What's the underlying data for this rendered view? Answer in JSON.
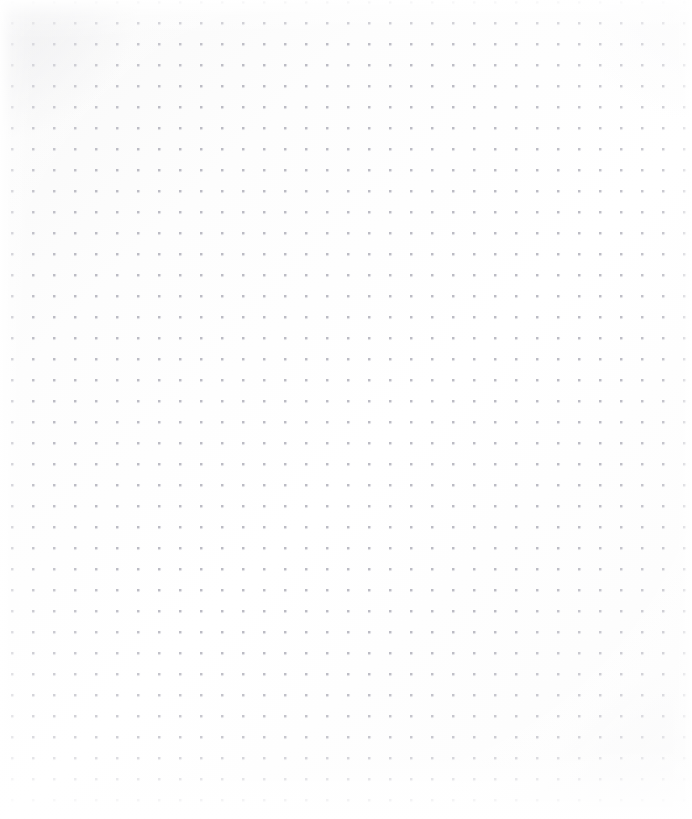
{
  "page": {
    "title": "Dot Grid Canvas",
    "kind": "blank-dot-grid",
    "width_px": 692,
    "height_px": 819,
    "visible_text": "",
    "notes_label": ""
  },
  "grid": {
    "name": "dot-grid",
    "pattern": "dot",
    "pitch_x_px": 21,
    "pitch_y_px": 21,
    "origin_x_px": 12,
    "origin_y_px": 22,
    "dot_diameter_px": 2,
    "columns": 33,
    "rows": 38,
    "dot_color": "#c3c3ca",
    "dot_color_soft": "#b2b2bc"
  },
  "surface": {
    "name": "paper-surface",
    "background_color": "#fdfdfd",
    "background_color_edge": "#f3f3f4",
    "highlight_color": "#ffffff",
    "vignette_color": "#ffffff",
    "corner_shade_color": "#dedee2"
  }
}
